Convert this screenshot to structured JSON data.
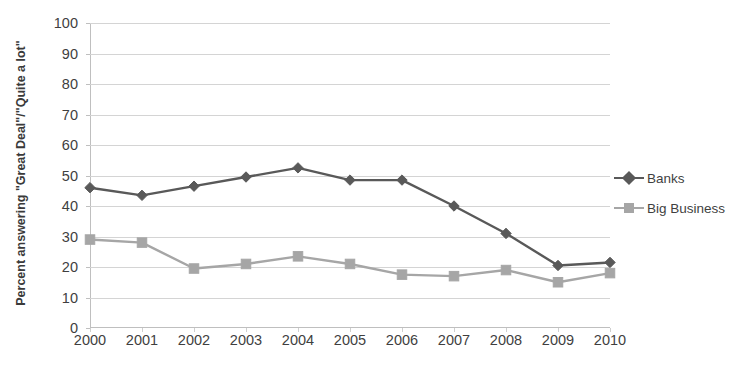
{
  "chart_data": {
    "type": "line",
    "title": "",
    "xlabel": "",
    "ylabel": "Percent answering \"Great Deal\"/\"Quite a lot\"",
    "categories": [
      "2000",
      "2001",
      "2002",
      "2003",
      "2004",
      "2005",
      "2006",
      "2007",
      "2008",
      "2009",
      "2010"
    ],
    "ylim": [
      0,
      100
    ],
    "ytick_step": 10,
    "yticks": [
      "100",
      "90",
      "80",
      "70",
      "60",
      "50",
      "40",
      "30",
      "20",
      "10",
      "0"
    ],
    "grid": true,
    "legend_position": "right",
    "series": [
      {
        "name": "Banks",
        "color": "#595959",
        "marker": "diamond",
        "values": [
          46,
          43.5,
          46.5,
          49.5,
          52.5,
          48.5,
          48.5,
          40,
          31,
          20.5,
          21.5
        ]
      },
      {
        "name": "Big Business",
        "color": "#a6a6a6",
        "marker": "square",
        "values": [
          29,
          28,
          19.5,
          21,
          23.5,
          21,
          17.5,
          17,
          19,
          15,
          18
        ]
      }
    ]
  },
  "axis": {
    "y_title": "Percent answering \"Great Deal\"/\"Quite a lot\""
  },
  "legend": {
    "items": [
      {
        "label": "Banks"
      },
      {
        "label": "Big Business"
      }
    ]
  },
  "colors": {
    "banks": "#595959",
    "big_business": "#a6a6a6",
    "gridline": "#d4d4d4",
    "axis": "#bfbfbf",
    "text": "#3f3f3f",
    "background": "#ffffff"
  }
}
